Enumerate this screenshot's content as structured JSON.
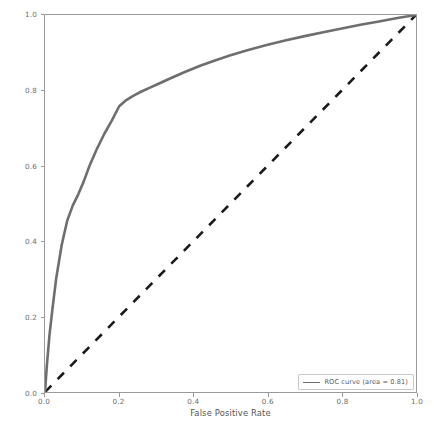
{
  "chart_data": {
    "type": "line",
    "title": "",
    "xlabel": "False Positive Rate",
    "ylabel": "True Positive Rate",
    "xlim": [
      0.0,
      1.0
    ],
    "ylim": [
      0.0,
      1.0
    ],
    "grid": false,
    "legend_position": "lower right",
    "xticks": [
      "0.0",
      "0.2",
      "0.4",
      "0.6",
      "0.8",
      "1.0"
    ],
    "xtick_values": [
      0.0,
      0.2,
      0.4,
      0.6,
      0.8,
      1.0
    ],
    "yticks": [
      "0.0",
      "0.2",
      "0.4",
      "0.6",
      "0.8",
      "1.0"
    ],
    "ytick_values": [
      0.0,
      0.2,
      0.4,
      0.6,
      0.8,
      1.0
    ],
    "series": [
      {
        "name": "ROC curve (area = 0.81)",
        "style": "solid",
        "color": "#6e6e6e",
        "area": 0.81,
        "x": [
          0.0,
          0.005,
          0.012,
          0.02,
          0.03,
          0.045,
          0.06,
          0.075,
          0.09,
          0.105,
          0.12,
          0.14,
          0.16,
          0.18,
          0.2,
          0.22,
          0.24,
          0.26,
          0.28,
          0.3,
          0.34,
          0.38,
          0.42,
          0.46,
          0.5,
          0.55,
          0.6,
          0.65,
          0.7,
          0.75,
          0.8,
          0.85,
          0.9,
          0.95,
          1.0
        ],
        "y": [
          0.0,
          0.07,
          0.15,
          0.22,
          0.3,
          0.39,
          0.455,
          0.495,
          0.525,
          0.56,
          0.6,
          0.645,
          0.685,
          0.72,
          0.758,
          0.775,
          0.787,
          0.797,
          0.806,
          0.815,
          0.833,
          0.85,
          0.866,
          0.88,
          0.893,
          0.908,
          0.921,
          0.933,
          0.944,
          0.954,
          0.964,
          0.974,
          0.983,
          0.992,
          1.0
        ]
      },
      {
        "name": "chance-diagonal",
        "style": "dashed",
        "color": "#1a1a1a",
        "x": [
          0.0,
          1.0
        ],
        "y": [
          0.0,
          1.0
        ]
      }
    ]
  },
  "legend": {
    "entries": [
      {
        "label": "ROC curve (area = 0.81)"
      }
    ]
  },
  "axes": {
    "xlabel": "False Positive Rate",
    "ylabel": "True Positive Rate"
  }
}
